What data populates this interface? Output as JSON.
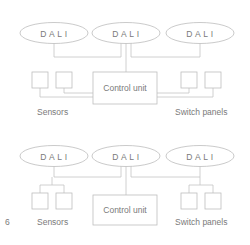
{
  "figure_number": "6",
  "diagrams": [
    {
      "name": "star-topology",
      "dali_nodes": [
        {
          "label": "DALI"
        },
        {
          "label": "DALI"
        },
        {
          "label": "DALI"
        }
      ],
      "control_unit": {
        "label": "Control unit"
      },
      "sensors": {
        "label": "Sensors",
        "count": 2
      },
      "switch_panels": {
        "label": "Switch panels",
        "count": 2
      }
    },
    {
      "name": "bus-topology",
      "dali_nodes": [
        {
          "label": "DALI"
        },
        {
          "label": "DALI"
        },
        {
          "label": "DALI"
        }
      ],
      "control_unit": {
        "label": "Control unit"
      },
      "sensors": {
        "label": "Sensors",
        "count": 2
      },
      "switch_panels": {
        "label": "Switch panels",
        "count": 2
      }
    }
  ],
  "colors": {
    "stroke": "#bdbdbd",
    "text": "#7a7a7a",
    "background": "#ffffff"
  }
}
